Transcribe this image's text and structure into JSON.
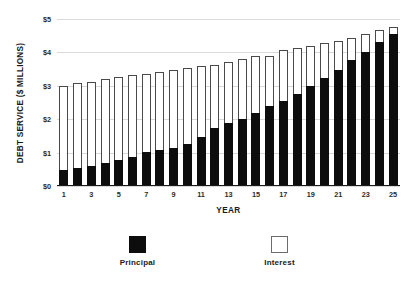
{
  "chart_data": {
    "type": "bar",
    "stacked": true,
    "title": "",
    "xlabel": "YEAR",
    "ylabel": "DEBT SERVICE ($ MILLIONS)",
    "ylim": [
      0,
      5
    ],
    "ytick_values": [
      0,
      1,
      2,
      3,
      4,
      5
    ],
    "ytick_labels": [
      "$0",
      "$1",
      "$2",
      "$3",
      "$4",
      "$5"
    ],
    "grid": true,
    "legend_position": "bottom",
    "categories": [
      1,
      2,
      3,
      4,
      5,
      6,
      7,
      8,
      9,
      10,
      11,
      12,
      13,
      14,
      15,
      16,
      17,
      18,
      19,
      20,
      21,
      22,
      23,
      24,
      25
    ],
    "xtick_labels": [
      "1",
      "3",
      "5",
      "7",
      "9",
      "11",
      "13",
      "15",
      "17",
      "19",
      "21",
      "23",
      "25"
    ],
    "xtick_values": [
      1,
      3,
      5,
      7,
      9,
      11,
      13,
      15,
      17,
      19,
      21,
      23,
      25
    ],
    "series": [
      {
        "name": "Principal",
        "color": "#0d0d0d",
        "values": [
          0.47,
          0.55,
          0.61,
          0.68,
          0.77,
          0.88,
          1.01,
          1.08,
          1.15,
          1.27,
          1.47,
          1.74,
          1.88,
          2.0,
          2.2,
          2.4,
          2.55,
          2.75,
          3.0,
          3.23,
          3.47,
          3.77,
          4.0,
          4.3,
          4.55
        ]
      },
      {
        "name": "Interest",
        "color": "#ffffff",
        "values": [
          2.53,
          2.54,
          2.51,
          2.52,
          2.48,
          2.43,
          2.34,
          2.34,
          2.33,
          2.26,
          2.11,
          1.89,
          1.82,
          1.81,
          1.7,
          1.5,
          1.52,
          1.38,
          1.19,
          1.04,
          0.87,
          0.67,
          0.54,
          0.36,
          0.2
        ]
      }
    ],
    "totals": [
      3.0,
      3.09,
      3.12,
      3.2,
      3.25,
      3.31,
      3.35,
      3.42,
      3.48,
      3.53,
      3.58,
      3.63,
      3.7,
      3.81,
      3.9,
      3.9,
      4.07,
      4.13,
      4.19,
      4.27,
      4.34,
      4.44,
      4.54,
      4.66,
      4.75
    ]
  },
  "legend": {
    "items": [
      {
        "label": "Principal",
        "swatch": "principal"
      },
      {
        "label": "Interest",
        "swatch": "interest"
      }
    ]
  }
}
